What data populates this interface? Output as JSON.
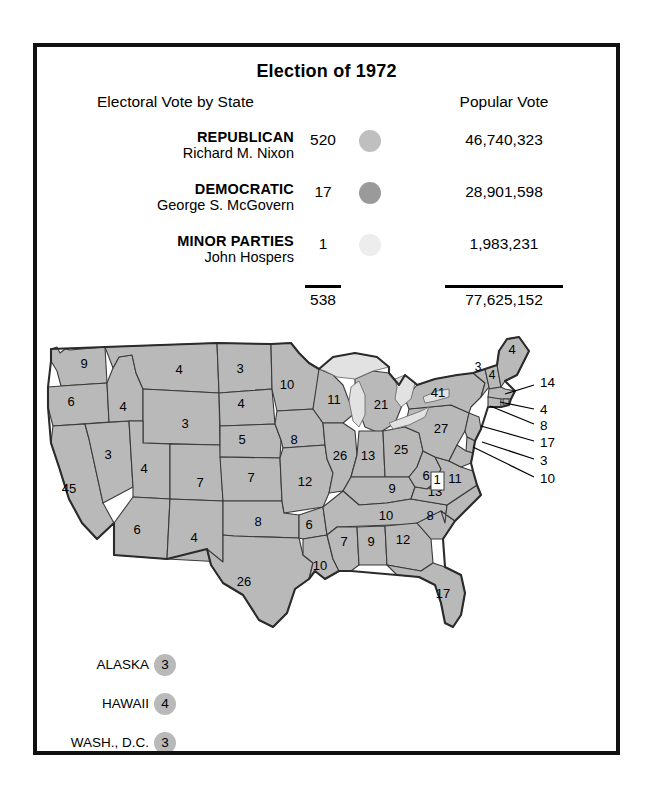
{
  "figure": {
    "title": "Election of 1972",
    "column_headers": {
      "electoral": "Electoral Vote by State",
      "popular": "Popular Vote"
    }
  },
  "legend": {
    "rows": [
      {
        "party": "REPUBLICAN",
        "candidate": "Richard M. Nixon",
        "electoral_votes": "520",
        "popular_votes": "46,740,323",
        "color": "#bfbfbf",
        "swatch_name": "republican-swatch"
      },
      {
        "party": "DEMOCRATIC",
        "candidate": "George S. McGovern",
        "electoral_votes": "17",
        "popular_votes": "28,901,598",
        "color": "#9a9a9a",
        "swatch_name": "democratic-swatch"
      },
      {
        "party": "MINOR PARTIES",
        "candidate": "John Hospers",
        "electoral_votes": "1",
        "popular_votes": "1,983,231",
        "color": "#ededed",
        "swatch_name": "minor-parties-swatch"
      }
    ],
    "totals": {
      "electoral": "538",
      "popular": "77,625,152"
    }
  },
  "map": {
    "land_color": "#b9b9b9",
    "lake_color": "#e2e2e2",
    "border_color": "#3a3a3a",
    "states": [
      {
        "code": "WA",
        "value": "9",
        "x": 47,
        "y": 38
      },
      {
        "code": "OR",
        "value": "6",
        "x": 34,
        "y": 76
      },
      {
        "code": "CA",
        "value": "45",
        "x": 32,
        "y": 163
      },
      {
        "code": "NV",
        "value": "3",
        "x": 71,
        "y": 129
      },
      {
        "code": "ID",
        "value": "4",
        "x": 86,
        "y": 81
      },
      {
        "code": "MT",
        "value": "4",
        "x": 142,
        "y": 44
      },
      {
        "code": "WY",
        "value": "3",
        "x": 148,
        "y": 98
      },
      {
        "code": "UT",
        "value": "4",
        "x": 107,
        "y": 143
      },
      {
        "code": "AZ",
        "value": "6",
        "x": 100,
        "y": 204
      },
      {
        "code": "CO",
        "value": "7",
        "x": 163,
        "y": 157
      },
      {
        "code": "NM",
        "value": "4",
        "x": 157,
        "y": 212
      },
      {
        "code": "ND",
        "value": "3",
        "x": 203,
        "y": 43
      },
      {
        "code": "SD",
        "value": "4",
        "x": 204,
        "y": 78
      },
      {
        "code": "NE",
        "value": "5",
        "x": 205,
        "y": 114
      },
      {
        "code": "KS",
        "value": "7",
        "x": 214,
        "y": 152
      },
      {
        "code": "OK",
        "value": "8",
        "x": 221,
        "y": 196
      },
      {
        "code": "TX",
        "value": "26",
        "x": 207,
        "y": 256
      },
      {
        "code": "MN",
        "value": "10",
        "x": 250,
        "y": 59
      },
      {
        "code": "IA",
        "value": "8",
        "x": 257,
        "y": 114
      },
      {
        "code": "MO",
        "value": "12",
        "x": 268,
        "y": 156
      },
      {
        "code": "AR",
        "value": "6",
        "x": 272,
        "y": 199
      },
      {
        "code": "LA",
        "value": "10",
        "x": 283,
        "y": 240
      },
      {
        "code": "WI",
        "value": "11",
        "x": 297,
        "y": 74
      },
      {
        "code": "IL",
        "value": "26",
        "x": 303,
        "y": 130
      },
      {
        "code": "MI",
        "value": "21",
        "x": 344,
        "y": 79
      },
      {
        "code": "IN",
        "value": "13",
        "x": 331,
        "y": 130
      },
      {
        "code": "OH",
        "value": "25",
        "x": 364,
        "y": 124
      },
      {
        "code": "KY",
        "value": "9",
        "x": 355,
        "y": 163
      },
      {
        "code": "TN",
        "value": "10",
        "x": 349,
        "y": 190
      },
      {
        "code": "MS",
        "value": "7",
        "x": 307,
        "y": 216
      },
      {
        "code": "AL",
        "value": "9",
        "x": 334,
        "y": 216
      },
      {
        "code": "GA",
        "value": "12",
        "x": 366,
        "y": 214
      },
      {
        "code": "FL",
        "value": "17",
        "x": 406,
        "y": 268
      },
      {
        "code": "SC",
        "value": "8",
        "x": 393,
        "y": 190
      },
      {
        "code": "NC",
        "value": "13",
        "x": 398,
        "y": 166
      },
      {
        "code": "WV",
        "value": "6",
        "x": 389,
        "y": 150
      },
      {
        "code": "VA",
        "value": "11",
        "x": 418,
        "y": 153
      },
      {
        "code": "PA",
        "value": "27",
        "x": 404,
        "y": 103
      },
      {
        "code": "NY",
        "value": "41",
        "x": 401,
        "y": 67
      },
      {
        "code": "VT",
        "value": "3",
        "x": 441,
        "y": 41
      },
      {
        "code": "NH",
        "value": "4",
        "x": 455,
        "y": 49
      },
      {
        "code": "ME",
        "value": "4",
        "x": 475,
        "y": 24
      }
    ],
    "dc_marker": {
      "value": "1",
      "x": 400,
      "y": 154
    },
    "callouts": [
      {
        "code": "MA",
        "value": "14",
        "label_x": 503,
        "label_y": 56,
        "line": "M 497 58 L 468 67"
      },
      {
        "code": "RI",
        "value": "4",
        "label_x": 503,
        "label_y": 83,
        "line": "M 497 82 L 463 75"
      },
      {
        "code": "CT",
        "value": "8",
        "label_x": 503,
        "label_y": 99,
        "line": "M 497 97 L 453 79"
      },
      {
        "code": "NJ",
        "value": "17",
        "label_x": 503,
        "label_y": 116,
        "line": "M 497 114 L 444 99"
      },
      {
        "code": "DE",
        "value": "3",
        "label_x": 503,
        "label_y": 134,
        "line": "M 497 132 L 445 115"
      },
      {
        "code": "MD",
        "value": "10",
        "label_x": 503,
        "label_y": 152,
        "line": "M 497 150 L 436 120"
      }
    ],
    "insets": [
      {
        "label": "ALASKA",
        "value": "3",
        "y": 338
      },
      {
        "label": "HAWAII",
        "value": "4",
        "y": 377
      },
      {
        "label": "WASH., D.C.",
        "value": "3",
        "y": 416
      }
    ]
  }
}
